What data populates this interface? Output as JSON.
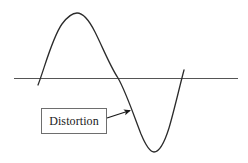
{
  "figure": {
    "background_color": "#ffffff",
    "width": 248,
    "height": 163,
    "annotation": {
      "label": "Distortion",
      "box": {
        "x": 41,
        "y": 108,
        "width": 66,
        "height": 26,
        "border_color": "#6e6e6e",
        "fill_color": "#ffffff",
        "text_color": "#1a1a1a"
      },
      "arrow": {
        "from_x": 107,
        "from_y": 118,
        "to_x": 131,
        "to_y": 110,
        "color": "#1a1a1a",
        "head": "solid-triangle"
      }
    },
    "axis": {
      "name": "horizontal-zero-axis",
      "x_start": 14,
      "x_end": 238,
      "y": 78,
      "color": "#555555",
      "width": 1
    },
    "waveform": {
      "name": "distorted-sine-curve",
      "color": "#2b2b2b",
      "width": 1.3,
      "path": "M 38 85 C 44 70 52 38 62 24 C 68 16 72 13 77 13 C 83 13 89 20 95 32 C 103 48 110 66 118 78 C 126 92 134 116 141 134 C 146 146 150 152 154 152 C 159 152 164 144 169 128 C 174 111 179 89 184 70"
    }
  },
  "chart_data": {
    "type": "line",
    "xlabel": "",
    "ylabel": "",
    "grid": false,
    "legend": "none",
    "axis_line_y": 0,
    "annotations": [
      {
        "text": "Distortion",
        "points_to_x": 0.58,
        "points_to_y": -0.44,
        "box_x": 0.12,
        "box_y": -0.55
      }
    ],
    "series": [
      {
        "name": "distorted-sine",
        "x": [
          0.0,
          0.08,
          0.16,
          0.24,
          0.32,
          0.4,
          0.47,
          0.55,
          0.63,
          0.71,
          0.79,
          0.87,
          0.95,
          1.0
        ],
        "y": [
          -0.1,
          0.19,
          0.63,
          0.9,
          0.9,
          0.64,
          0.24,
          0.0,
          -0.45,
          -0.78,
          -1.03,
          -0.93,
          -0.51,
          0.11
        ],
        "ylim": [
          -1.1,
          1.0
        ],
        "xlim": [
          0,
          1
        ]
      }
    ]
  }
}
